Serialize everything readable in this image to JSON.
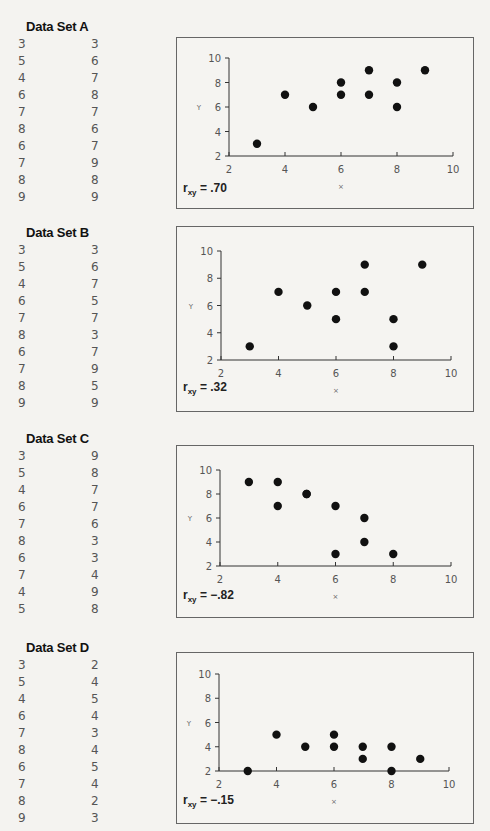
{
  "datasets": [
    {
      "title": "Data Set A",
      "rows": [
        [
          3,
          3
        ],
        [
          5,
          6
        ],
        [
          4,
          7
        ],
        [
          6,
          8
        ],
        [
          7,
          7
        ],
        [
          8,
          6
        ],
        [
          6,
          7
        ],
        [
          7,
          9
        ],
        [
          8,
          8
        ],
        [
          9,
          9
        ]
      ],
      "r_prefix": "r",
      "r_sub": "xy",
      "r_value": " = .70"
    },
    {
      "title": "Data Set B",
      "rows": [
        [
          3,
          3
        ],
        [
          5,
          6
        ],
        [
          4,
          7
        ],
        [
          6,
          5
        ],
        [
          7,
          7
        ],
        [
          8,
          3
        ],
        [
          6,
          7
        ],
        [
          7,
          9
        ],
        [
          8,
          5
        ],
        [
          9,
          9
        ]
      ],
      "r_prefix": "r",
      "r_sub": "xy",
      "r_value": " = .32"
    },
    {
      "title": "Data Set C",
      "rows": [
        [
          3,
          9
        ],
        [
          5,
          8
        ],
        [
          4,
          7
        ],
        [
          6,
          7
        ],
        [
          7,
          6
        ],
        [
          8,
          3
        ],
        [
          6,
          3
        ],
        [
          7,
          4
        ],
        [
          4,
          9
        ],
        [
          5,
          8
        ]
      ],
      "r_prefix": "r",
      "r_sub": "xy",
      "r_value": " = −.82"
    },
    {
      "title": "Data Set D",
      "rows": [
        [
          3,
          2
        ],
        [
          5,
          4
        ],
        [
          4,
          5
        ],
        [
          6,
          4
        ],
        [
          7,
          3
        ],
        [
          8,
          4
        ],
        [
          6,
          5
        ],
        [
          7,
          4
        ],
        [
          8,
          2
        ],
        [
          9,
          3
        ]
      ],
      "r_prefix": "r",
      "r_sub": "xy",
      "r_value": " = −.15"
    }
  ],
  "axes": {
    "xlabel": "X",
    "ylabel": "Y",
    "xticks": [
      "2",
      "4",
      "6",
      "8",
      "10"
    ],
    "yticks": [
      "2",
      "4",
      "6",
      "8",
      "10"
    ]
  },
  "colors": {
    "point": "#111111",
    "axis": "#333333",
    "frame": "#666666",
    "table_text": "#555555"
  },
  "chart_data": [
    {
      "type": "scatter",
      "title": "Data Set A",
      "xlabel": "X",
      "ylabel": "Y",
      "xlim": [
        2,
        10
      ],
      "ylim": [
        2,
        10
      ],
      "x": [
        3,
        5,
        4,
        6,
        7,
        8,
        6,
        7,
        8,
        9
      ],
      "y": [
        3,
        6,
        7,
        8,
        7,
        6,
        7,
        9,
        8,
        9
      ],
      "annotation": "r_xy = .70",
      "grid": false
    },
    {
      "type": "scatter",
      "title": "Data Set B",
      "xlabel": "X",
      "ylabel": "Y",
      "xlim": [
        2,
        10
      ],
      "ylim": [
        2,
        10
      ],
      "x": [
        3,
        5,
        4,
        6,
        7,
        8,
        6,
        7,
        8,
        9
      ],
      "y": [
        3,
        6,
        7,
        5,
        7,
        3,
        7,
        9,
        5,
        9
      ],
      "annotation": "r_xy = .32",
      "grid": false
    },
    {
      "type": "scatter",
      "title": "Data Set C",
      "xlabel": "X",
      "ylabel": "Y",
      "xlim": [
        2,
        10
      ],
      "ylim": [
        2,
        10
      ],
      "x": [
        3,
        5,
        4,
        6,
        7,
        8,
        6,
        7,
        4,
        5
      ],
      "y": [
        9,
        8,
        7,
        7,
        6,
        3,
        3,
        4,
        9,
        8
      ],
      "annotation": "r_xy = -.82",
      "grid": false
    },
    {
      "type": "scatter",
      "title": "Data Set D",
      "xlabel": "X",
      "ylabel": "Y",
      "xlim": [
        2,
        10
      ],
      "ylim": [
        2,
        10
      ],
      "x": [
        3,
        5,
        4,
        6,
        7,
        8,
        6,
        7,
        8,
        9
      ],
      "y": [
        2,
        4,
        5,
        4,
        3,
        4,
        5,
        4,
        2,
        3
      ],
      "annotation": "r_xy = -.15",
      "grid": false
    }
  ]
}
